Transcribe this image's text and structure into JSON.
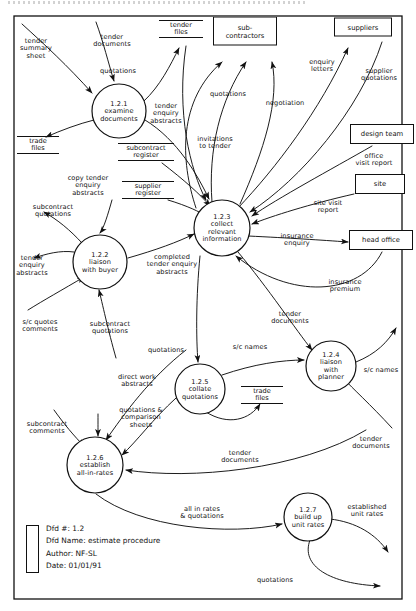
{
  "diagram": {
    "border": "#111111",
    "processes": [
      {
        "id": "1.2.1",
        "name": "examine\ndocuments",
        "cx": 119,
        "cy": 111,
        "r": 27
      },
      {
        "id": "1.2.2",
        "name": "liaison\nwith buyer",
        "cx": 100,
        "cy": 262,
        "r": 27
      },
      {
        "id": "1.2.3",
        "name": "collect\nrelevant\ninformation",
        "cx": 222,
        "cy": 228,
        "r": 28
      },
      {
        "id": "1.2.4",
        "name": "liaison\nwith\nplanner",
        "cx": 331,
        "cy": 366,
        "r": 25
      },
      {
        "id": "1.2.5",
        "name": "collate\nquotations",
        "cx": 200,
        "cy": 389,
        "r": 25
      },
      {
        "id": "1.2.6",
        "name": "establish\nall-in-rates",
        "cx": 95,
        "cy": 465,
        "r": 28
      },
      {
        "id": "1.2.7",
        "name": "build up\nunit rates",
        "cx": 308,
        "cy": 517,
        "r": 24
      }
    ],
    "entities": [
      {
        "label": "sub-\ncontractors",
        "x": 245,
        "y": 31,
        "w": 62,
        "h": 27
      },
      {
        "label": "suppliers",
        "x": 363,
        "y": 27,
        "w": 56,
        "h": 17
      },
      {
        "label": "design team",
        "x": 382,
        "y": 134,
        "w": 62,
        "h": 18
      },
      {
        "label": "site",
        "x": 380,
        "y": 184,
        "w": 48,
        "h": 18
      },
      {
        "label": "head office",
        "x": 381,
        "y": 240,
        "w": 62,
        "h": 18
      }
    ],
    "stores": [
      {
        "label": "tender\nfiles",
        "x": 181,
        "y": 29,
        "w": 44
      },
      {
        "label": "trade\nfiles",
        "x": 38,
        "y": 145,
        "w": 42
      },
      {
        "label": "subcontract\nregister",
        "x": 146,
        "y": 152,
        "w": 56
      },
      {
        "label": "supplier\nregister",
        "x": 148,
        "y": 190,
        "w": 52
      },
      {
        "label": "trade\nfiles",
        "x": 262,
        "y": 395,
        "w": 42
      }
    ],
    "flows": [
      {
        "label": "tender\nsummary\nsheet",
        "x": 36,
        "y": 49
      },
      {
        "label": "tender\ndocuments",
        "x": 112,
        "y": 41
      },
      {
        "label": "tender\nenquiry\nabstracts",
        "x": 166,
        "y": 114
      },
      {
        "label": "copy tender\nenquiry\nabstracts",
        "x": 88,
        "y": 186
      },
      {
        "label": "subcontract\nquotations",
        "x": 53,
        "y": 211
      },
      {
        "label": "tender\nenquiry\nabstracts",
        "x": 32,
        "y": 266
      },
      {
        "label": "s/c quotes\ncomments",
        "x": 40,
        "y": 326
      },
      {
        "label": "subcontract\nquotations",
        "x": 110,
        "y": 328
      },
      {
        "label": "completed\ntender enquiry\nabstracts",
        "x": 172,
        "y": 265
      },
      {
        "label": "quotations",
        "x": 118,
        "y": 72
      },
      {
        "label": "invitations\nto tender",
        "x": 215,
        "y": 143
      },
      {
        "label": "quotations",
        "x": 228,
        "y": 95
      },
      {
        "label": "negotiation",
        "x": 285,
        "y": 104
      },
      {
        "label": "enquiry\nletters",
        "x": 322,
        "y": 66
      },
      {
        "label": "supplier\nquotations",
        "x": 379,
        "y": 75
      },
      {
        "label": "office\nvisit report",
        "x": 374,
        "y": 160
      },
      {
        "label": "site visit\nreport",
        "x": 328,
        "y": 207
      },
      {
        "label": "insurance\nenquiry",
        "x": 297,
        "y": 240
      },
      {
        "label": "insurance\npremium",
        "x": 345,
        "y": 286
      },
      {
        "label": "tender\ndocuments",
        "x": 290,
        "y": 318
      },
      {
        "label": "s/c names",
        "x": 250,
        "y": 348
      },
      {
        "label": "s/c names",
        "x": 381,
        "y": 371
      },
      {
        "label": "quotations",
        "x": 166,
        "y": 351
      },
      {
        "label": "direct work\nabstracts",
        "x": 137,
        "y": 381
      },
      {
        "label": "quotations &\ncomparison\nsheets",
        "x": 141,
        "y": 418
      },
      {
        "label": "subcontract\ncomments",
        "x": 47,
        "y": 428
      },
      {
        "label": "tender\ndocuments",
        "x": 240,
        "y": 457
      },
      {
        "label": "tender\ndocuments",
        "x": 371,
        "y": 443
      },
      {
        "label": "all in rates\n& quotations",
        "x": 202,
        "y": 513
      },
      {
        "label": "established\nunit rates",
        "x": 367,
        "y": 511
      },
      {
        "label": "quotations",
        "x": 275,
        "y": 581
      }
    ]
  },
  "legend": {
    "dfd_number": "Dfd #: 1.2",
    "dfd_name": "Dfd Name: estimate procedure",
    "author": "Author: NF-SL",
    "date": "Date: 01/01/91"
  }
}
